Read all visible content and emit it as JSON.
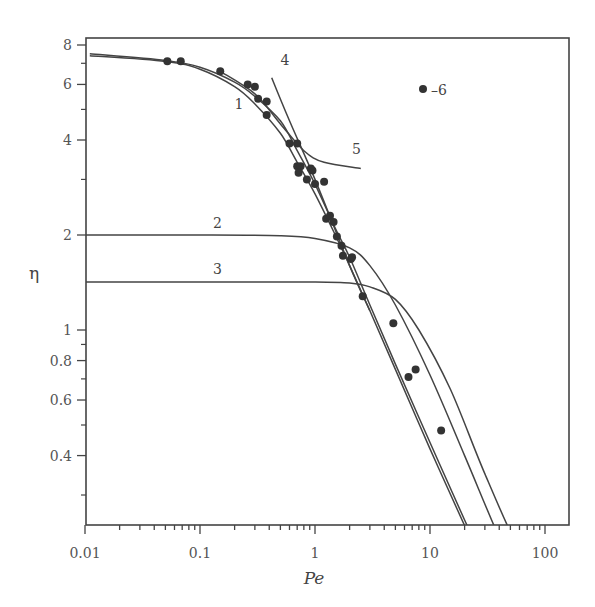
{
  "chart_data": {
    "type": "line",
    "title": "",
    "xlabel": "Pe",
    "ylabel": "η",
    "xscale": "log",
    "yscale": "log",
    "xlim": [
      0.01,
      150
    ],
    "ylim": [
      0.27,
      8.5
    ],
    "grid": false,
    "x_ticks": [
      0.01,
      0.1,
      1,
      10,
      100
    ],
    "x_tick_labels": [
      "0.01",
      "0.1",
      "1",
      "10",
      "100"
    ],
    "y_ticks": [
      0.4,
      0.6,
      0.8,
      1,
      2,
      4,
      6,
      8
    ],
    "y_tick_labels": [
      "0.4",
      "0.6",
      "0.8",
      "1",
      "2",
      "4",
      "6",
      "8"
    ],
    "legend": {
      "position": "upper right",
      "entries": [
        {
          "marker": "filled-circle",
          "label": "–6"
        }
      ]
    },
    "series": [
      {
        "name": "1",
        "kind": "line",
        "points": [
          [
            0.011,
            7.4
          ],
          [
            0.05,
            7.1
          ],
          [
            0.1,
            6.7
          ],
          [
            0.2,
            5.9
          ],
          [
            0.3,
            5.2
          ],
          [
            0.5,
            4.2
          ],
          [
            0.7,
            3.4
          ],
          [
            1,
            2.7
          ],
          [
            1.5,
            2.0
          ],
          [
            2,
            1.6
          ],
          [
            3,
            1.15
          ],
          [
            5,
            0.75
          ],
          [
            10,
            0.42
          ],
          [
            20,
            0.24
          ],
          [
            36,
            0.15
          ]
        ]
      },
      {
        "name": "1b",
        "kind": "line",
        "points": [
          [
            0.011,
            7.5
          ],
          [
            0.05,
            7.15
          ],
          [
            0.1,
            6.8
          ],
          [
            0.2,
            6.1
          ],
          [
            0.3,
            5.5
          ],
          [
            0.5,
            4.6
          ],
          [
            0.7,
            3.7
          ],
          [
            1,
            2.9
          ],
          [
            1.5,
            2.1
          ],
          [
            2,
            1.7
          ],
          [
            3,
            1.2
          ],
          [
            5,
            0.78
          ],
          [
            10,
            0.44
          ],
          [
            20,
            0.25
          ],
          [
            38,
            0.15
          ]
        ]
      },
      {
        "name": "2",
        "kind": "line",
        "points": [
          [
            0.01,
            2.0
          ],
          [
            0.1,
            2.0
          ],
          [
            0.5,
            1.99
          ],
          [
            1,
            1.95
          ],
          [
            2,
            1.82
          ],
          [
            3,
            1.6
          ],
          [
            5,
            1.2
          ],
          [
            10,
            0.72
          ],
          [
            20,
            0.4
          ],
          [
            40,
            0.22
          ],
          [
            68,
            0.15
          ]
        ]
      },
      {
        "name": "3",
        "kind": "line",
        "points": [
          [
            0.01,
            1.42
          ],
          [
            0.1,
            1.42
          ],
          [
            1,
            1.42
          ],
          [
            2,
            1.41
          ],
          [
            3,
            1.37
          ],
          [
            5,
            1.25
          ],
          [
            8,
            1.0
          ],
          [
            15,
            0.65
          ],
          [
            30,
            0.35
          ],
          [
            60,
            0.2
          ],
          [
            105,
            0.15
          ]
        ]
      },
      {
        "name": "4",
        "kind": "line",
        "points": [
          [
            0.42,
            6.3
          ],
          [
            0.6,
            4.6
          ],
          [
            1,
            3.0
          ],
          [
            2,
            1.6
          ],
          [
            3,
            1.15
          ]
        ]
      },
      {
        "name": "5",
        "kind": "line",
        "points": [
          [
            0.15,
            6.6
          ],
          [
            0.3,
            5.6
          ],
          [
            0.5,
            4.5
          ],
          [
            0.8,
            3.7
          ],
          [
            1.2,
            3.4
          ],
          [
            2.5,
            3.25
          ]
        ]
      },
      {
        "name": "6",
        "kind": "scatter",
        "points": [
          [
            0.052,
            7.1
          ],
          [
            0.068,
            7.1
          ],
          [
            0.15,
            6.6
          ],
          [
            0.26,
            6.0
          ],
          [
            0.3,
            5.9
          ],
          [
            0.32,
            5.4
          ],
          [
            0.38,
            5.3
          ],
          [
            0.38,
            4.8
          ],
          [
            0.6,
            3.9
          ],
          [
            0.7,
            3.9
          ],
          [
            0.7,
            3.3
          ],
          [
            0.75,
            3.3
          ],
          [
            0.72,
            3.15
          ],
          [
            0.85,
            3.0
          ],
          [
            0.95,
            3.2
          ],
          [
            0.92,
            3.25
          ],
          [
            1.0,
            2.9
          ],
          [
            1.2,
            2.95
          ],
          [
            1.25,
            2.25
          ],
          [
            1.35,
            2.3
          ],
          [
            1.45,
            2.2
          ],
          [
            1.55,
            1.98
          ],
          [
            1.7,
            1.85
          ],
          [
            1.75,
            1.72
          ],
          [
            2.05,
            1.68
          ],
          [
            2.1,
            1.7
          ],
          [
            2.6,
            1.28
          ],
          [
            4.8,
            1.05
          ],
          [
            7.5,
            0.75
          ],
          [
            6.5,
            0.71
          ],
          [
            12.5,
            0.48
          ]
        ]
      }
    ],
    "curve_labels": [
      {
        "text": "1",
        "x": 0.2,
        "y": 5.0
      },
      {
        "text": "2",
        "x": 0.13,
        "y": 2.1
      },
      {
        "text": "3",
        "x": 0.13,
        "y": 1.5
      },
      {
        "text": "4",
        "x": 0.5,
        "y": 6.9
      },
      {
        "text": "5",
        "x": 2.1,
        "y": 3.6
      }
    ]
  }
}
